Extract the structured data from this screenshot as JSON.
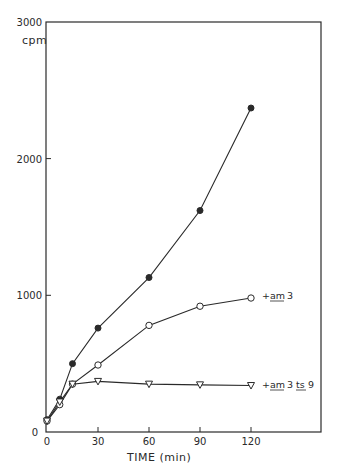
{
  "chart_data": {
    "type": "line",
    "title": "",
    "xlabel": "TIME (min)",
    "ylabel": "cpm",
    "xlim": [
      0,
      160
    ],
    "ylim": [
      0,
      3000
    ],
    "x_ticks": [
      0,
      30,
      60,
      90,
      120
    ],
    "y_ticks": [
      0,
      1000,
      2000,
      3000
    ],
    "x_tick_labels": [
      "0",
      "30",
      "60",
      "90",
      "120"
    ],
    "y_tick_labels": [
      "0",
      "1000",
      "2000",
      "3000"
    ],
    "grid": false,
    "legend": "inline labels at line ends",
    "series": [
      {
        "name": "control",
        "marker": "filled-circle",
        "label": "",
        "x": [
          0,
          7.5,
          15,
          30,
          60,
          90,
          120
        ],
        "values": [
          90,
          240,
          500,
          760,
          1130,
          1620,
          2370
        ]
      },
      {
        "name": "+ am 3",
        "marker": "open-circle",
        "label": "+ am 3",
        "label_underlined": [
          "am"
        ],
        "x": [
          0,
          7.5,
          15,
          30,
          60,
          90,
          120
        ],
        "values": [
          80,
          200,
          350,
          490,
          780,
          920,
          980
        ]
      },
      {
        "name": "+ am 3 ts 9",
        "marker": "open-triangle-down",
        "label": "+ am 3 ts 9",
        "label_underlined": [
          "am",
          "ts"
        ],
        "x": [
          0,
          7.5,
          15,
          30,
          60,
          90,
          120
        ],
        "values": [
          80,
          220,
          350,
          370,
          350,
          345,
          340
        ]
      }
    ]
  },
  "labels": {
    "ylabel": "cpm",
    "xlabel": "TIME (min)",
    "y_origin": "0",
    "series_1_plus": "+",
    "series_1_am": "am",
    "series_1_num": "3",
    "series_2_plus": "+",
    "series_2_am": "am",
    "series_2_num": "3",
    "series_2_ts": "ts",
    "series_2_num2": "9"
  },
  "colors": {
    "ink": "#2a2a2a",
    "background": "#ffffff"
  }
}
